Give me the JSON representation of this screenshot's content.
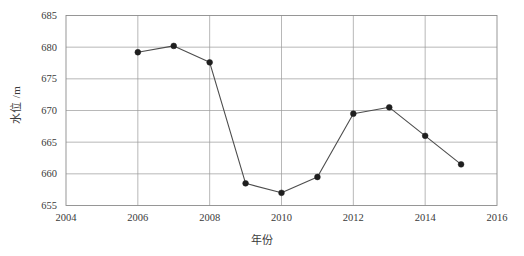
{
  "chart_data": {
    "type": "line",
    "title": "",
    "xlabel": "年份",
    "ylabel": "水位 /m",
    "x": [
      2006,
      2007,
      2008,
      2009,
      2010,
      2011,
      2012,
      2013,
      2014,
      2015
    ],
    "values": [
      679.2,
      680.2,
      677.6,
      658.5,
      657.0,
      659.5,
      669.5,
      670.5,
      666.0,
      661.5
    ],
    "series": [
      {
        "name": "水位",
        "x": [
          2006,
          2007,
          2008,
          2009,
          2010,
          2011,
          2012,
          2013,
          2014,
          2015
        ],
        "values": [
          679.2,
          680.2,
          677.6,
          658.5,
          657.0,
          659.5,
          669.5,
          670.5,
          666.0,
          661.5
        ]
      }
    ],
    "xlim": [
      2004,
      2016
    ],
    "ylim": [
      655,
      685
    ],
    "xticks": [
      2004,
      2006,
      2008,
      2010,
      2012,
      2014,
      2016
    ],
    "xtick_labels": [
      "2004",
      "2006",
      "2008",
      "2010",
      "2012",
      "2014",
      "2016"
    ],
    "yticks": [
      655,
      660,
      665,
      670,
      675,
      680,
      685
    ],
    "ytick_labels": [
      "655",
      "660",
      "665",
      "670",
      "675",
      "680",
      "685"
    ],
    "grid": true,
    "legend": null,
    "legend_position": "none",
    "marker": "filled-circle",
    "colors": {
      "line": "#4d4d4d",
      "marker": "#1f1f1f",
      "grid": "#9a9a9a",
      "frame": "#8c8c8c",
      "text": "#3a3a3a",
      "background": "#ffffff"
    }
  }
}
